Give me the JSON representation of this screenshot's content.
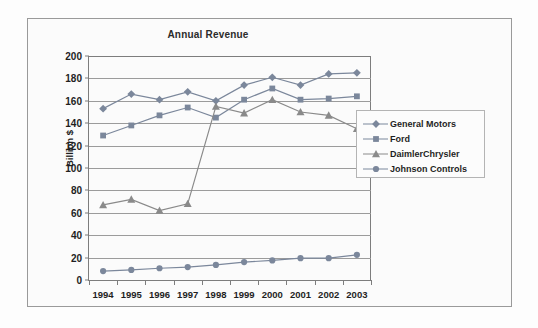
{
  "chart_data": {
    "type": "line",
    "title": "Annual Revenue",
    "xlabel": "",
    "ylabel": "Billion $",
    "categories": [
      "1994",
      "1995",
      "1996",
      "1997",
      "1998",
      "1999",
      "2000",
      "2001",
      "2002",
      "2003"
    ],
    "ylim": [
      0,
      200
    ],
    "ytick_step": 20,
    "yticks": [
      "200",
      "180",
      "160",
      "140",
      "120",
      "100",
      "80",
      "60",
      "40",
      "20",
      "0"
    ],
    "grid": true,
    "legend_position": "right",
    "series": [
      {
        "name": "General Motors",
        "marker": "diamond",
        "color": "#7b879b",
        "values": [
          153,
          166,
          161,
          168,
          160,
          174,
          181,
          174,
          184,
          185
        ]
      },
      {
        "name": "Ford",
        "marker": "square",
        "color": "#7b879b",
        "values": [
          129,
          138,
          147,
          154,
          145,
          161,
          171,
          161,
          162,
          164
        ]
      },
      {
        "name": "DaimlerChrysler",
        "marker": "triangle",
        "color": "#8a8a8a",
        "values": [
          67,
          72,
          62,
          68,
          155,
          149,
          161,
          150,
          147,
          135
        ]
      },
      {
        "name": "Johnson Controls",
        "marker": "circle",
        "color": "#7b879b",
        "values": [
          8,
          9,
          10.5,
          11.5,
          13.5,
          16,
          17.5,
          19.5,
          19.5,
          22.5
        ]
      }
    ]
  },
  "colors": {
    "axis": "#7d7d7d",
    "grid": "#9b9b9b",
    "frame": "#9a9a9a",
    "text": "#1f1f1f",
    "background": "#fbfbfb"
  }
}
